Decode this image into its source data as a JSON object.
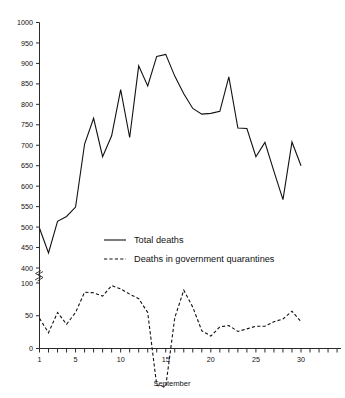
{
  "chart_data": {
    "type": "line",
    "title": "",
    "xlabel": "September",
    "ylabel": "",
    "x": [
      1,
      2,
      3,
      4,
      5,
      6,
      7,
      8,
      9,
      10,
      11,
      12,
      13,
      14,
      15,
      16,
      17,
      18,
      19,
      20,
      21,
      22,
      23,
      24,
      25,
      26,
      27,
      28,
      29,
      30
    ],
    "xtick_labels": [
      "1",
      "5",
      "10",
      "15",
      "20",
      "25",
      "30"
    ],
    "xtick_values": [
      1,
      5,
      10,
      15,
      20,
      25,
      30
    ],
    "xlim": [
      1,
      30
    ],
    "ytick_labels": [
      "0",
      "50",
      "100",
      "400",
      "450",
      "500",
      "550",
      "600",
      "650",
      "700",
      "750",
      "800",
      "850",
      "900",
      "950",
      "1000"
    ],
    "ytick_values": [
      0,
      50,
      100,
      400,
      450,
      500,
      550,
      600,
      650,
      700,
      750,
      800,
      850,
      900,
      950,
      1000
    ],
    "ylim": [
      0,
      1000
    ],
    "axis_break": true,
    "axis_break_between": [
      100,
      400
    ],
    "grid": false,
    "legend_position": "center",
    "series": [
      {
        "name": "Total deaths",
        "style": "solid",
        "values": [
          497,
          437,
          514,
          526,
          549,
          703,
          766,
          672,
          723,
          836,
          719,
          894,
          845,
          917,
          922,
          869,
          826,
          790,
          776,
          778,
          783,
          867,
          742,
          741,
          672,
          707,
          636,
          567,
          708,
          650
        ]
      },
      {
        "name": "Deaths in government quarantines",
        "style": "dashed",
        "values": [
          46,
          24,
          55,
          37,
          55,
          86,
          85,
          80,
          96,
          91,
          83,
          76,
          55,
          113,
          110,
          47,
          89,
          63,
          27,
          19,
          33,
          35,
          26,
          30,
          34,
          34,
          41,
          45,
          57,
          41
        ]
      }
    ]
  },
  "legend": {
    "items": [
      {
        "label": "Total deaths",
        "style": "solid"
      },
      {
        "label": "Deaths in government quarantines",
        "style": "dashed"
      }
    ]
  },
  "axis": {
    "x_title": "September"
  }
}
